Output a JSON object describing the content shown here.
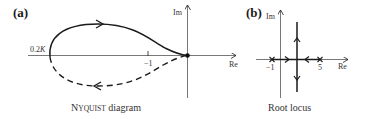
{
  "panels": [
    {
      "id": "a",
      "label": "(a)",
      "caption_first": "N",
      "caption_smallcaps": "YQUIST",
      "caption_rest": " diagram",
      "axes": {
        "x_label": "Re",
        "y_label": "Im"
      },
      "ticks": [
        {
          "value": "−1"
        }
      ],
      "annotations": [
        {
          "text": "0.2",
          "italic": "K"
        }
      ],
      "curves": [
        {
          "style": "solid",
          "direction": "right",
          "description": "upper half of Nyquist contour"
        },
        {
          "style": "dashed",
          "direction": "left",
          "description": "mirror image (negative frequencies)"
        }
      ],
      "points": [
        {
          "name": "origin",
          "marker": "dot"
        }
      ]
    },
    {
      "id": "b",
      "label": "(b)",
      "caption": "Root locus",
      "axes": {
        "x_label": "Re",
        "y_label": "Im"
      },
      "ticks": [
        {
          "value": "−1"
        },
        {
          "value": "5"
        }
      ],
      "poles": [
        {
          "re": -1,
          "marker": "x"
        },
        {
          "re": 5,
          "marker": "x"
        }
      ],
      "branches": [
        {
          "description": "from -1 rightwards to breakaway point"
        },
        {
          "description": "from 5 leftwards to breakaway point"
        },
        {
          "description": "vertical branch upward"
        },
        {
          "description": "vertical branch downward"
        }
      ]
    }
  ],
  "colors": {
    "stroke": "#1a1a1a",
    "text": "#333333",
    "background": "#ffffff"
  }
}
